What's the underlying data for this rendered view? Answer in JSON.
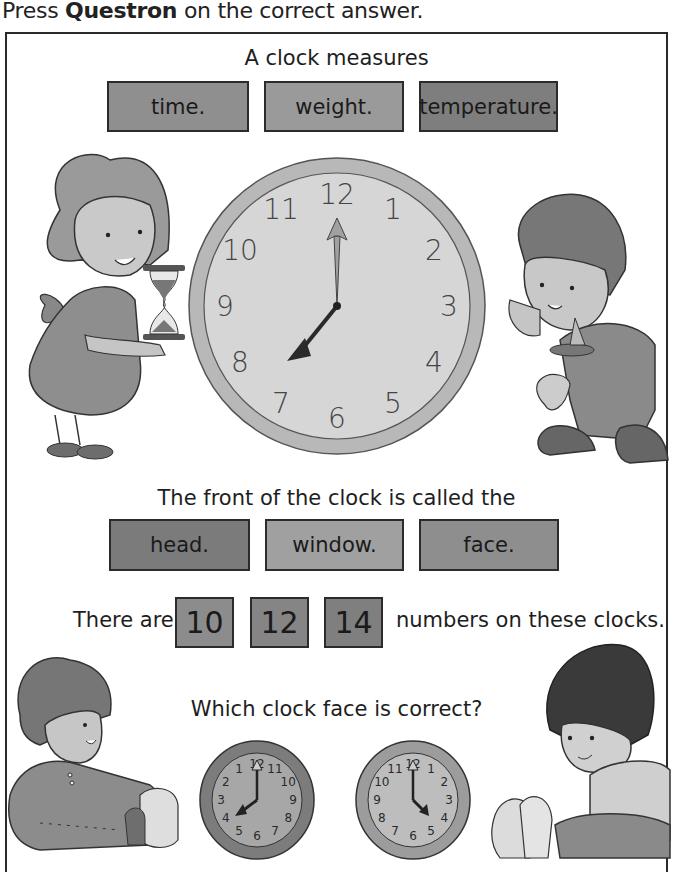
{
  "instruction": {
    "prefix": "Press ",
    "bold": "Questron",
    "suffix": " on the correct answer."
  },
  "questions": [
    {
      "prompt": "A clock measures",
      "answers": [
        {
          "label": "time.",
          "color": "#8f8f8f"
        },
        {
          "label": "weight.",
          "color": "#9a9a9a"
        },
        {
          "label": "temperature.",
          "color": "#7e7e7e"
        }
      ]
    },
    {
      "prompt": "The front of the clock is called the",
      "answers": [
        {
          "label": "head.",
          "color": "#7b7b7b"
        },
        {
          "label": "window.",
          "color": "#a0a0a0"
        },
        {
          "label": "face.",
          "color": "#8e8e8e"
        }
      ]
    },
    {
      "prompt_before": "There are",
      "prompt_after": "numbers on these clocks.",
      "answers": [
        {
          "label": "10",
          "color": "#8c8c8c"
        },
        {
          "label": "12",
          "color": "#858585"
        },
        {
          "label": "14",
          "color": "#7f7f7f"
        }
      ]
    },
    {
      "prompt": "Which clock face is correct?",
      "answers": [
        {
          "label": "mirrored-clock",
          "numbers": [
            "12",
            "11",
            "10",
            "9",
            "8",
            "7",
            "6",
            "5",
            "4",
            "3",
            "2",
            "1"
          ]
        },
        {
          "label": "correct-clock",
          "numbers": [
            "12",
            "1",
            "2",
            "3",
            "4",
            "5",
            "6",
            "7",
            "8",
            "9",
            "10",
            "11"
          ]
        }
      ]
    }
  ],
  "big_clock": {
    "numbers": [
      "12",
      "1",
      "2",
      "3",
      "4",
      "5",
      "6",
      "7",
      "8",
      "9",
      "10",
      "11"
    ],
    "time": "7:00"
  },
  "colors": {
    "clock_rim": "#b8b8b8",
    "clock_face": "#d6d6d6",
    "frame": "#2a2a2a"
  }
}
